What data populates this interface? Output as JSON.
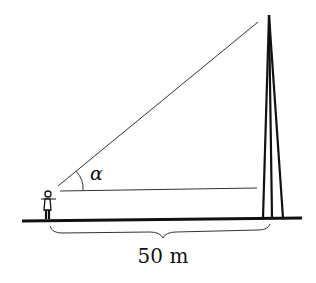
{
  "figure": {
    "angle_label": "α",
    "distance_label": "50 m",
    "colors": {
      "ink": "#111111",
      "background": "#ffffff"
    }
  }
}
